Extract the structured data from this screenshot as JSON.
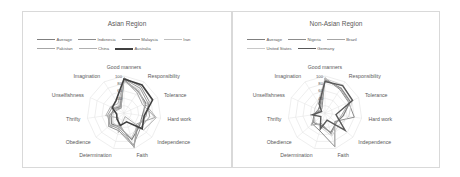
{
  "chart_data": [
    {
      "type": "radar",
      "title": "Asian Region",
      "axes": [
        "Good manners",
        "Responsibility",
        "Tolerance",
        "Hard work",
        "Independence",
        "Faith",
        "Determination",
        "Obedience",
        "Thrifty",
        "Unselfishness",
        "Imagination"
      ],
      "ticks": [
        "100",
        "80",
        "60",
        "40",
        "20"
      ],
      "range": [
        0,
        100
      ],
      "legend_rows": [
        [
          "Average",
          "Indonesia",
          "Malaysia",
          "Iran"
        ],
        [
          "Pakistan",
          "China",
          "Australia"
        ]
      ],
      "series": [
        {
          "name": "Average",
          "color": "#7f7f7f",
          "width": 1.2,
          "values": [
            90,
            70,
            65,
            50,
            55,
            75,
            40,
            45,
            35,
            30,
            20
          ]
        },
        {
          "name": "Indonesia",
          "color": "#8c8c8c",
          "width": 1.0,
          "values": [
            95,
            85,
            75,
            60,
            50,
            95,
            50,
            55,
            40,
            25,
            15
          ]
        },
        {
          "name": "Malaysia",
          "color": "#9a9a9a",
          "width": 1.0,
          "values": [
            92,
            80,
            70,
            70,
            60,
            90,
            45,
            50,
            45,
            35,
            20
          ]
        },
        {
          "name": "Iran",
          "color": "#bfbfbf",
          "width": 0.8,
          "values": [
            85,
            75,
            60,
            55,
            50,
            70,
            40,
            40,
            30,
            30,
            25
          ]
        },
        {
          "name": "Pakistan",
          "color": "#a6a6a6",
          "width": 1.0,
          "values": [
            90,
            65,
            55,
            85,
            45,
            98,
            35,
            55,
            40,
            20,
            15
          ]
        },
        {
          "name": "China",
          "color": "#b0b0b0",
          "width": 1.0,
          "values": [
            88,
            70,
            62,
            88,
            70,
            10,
            55,
            20,
            50,
            40,
            30
          ]
        },
        {
          "name": "Australia",
          "color": "#404040",
          "width": 1.6,
          "values": [
            92,
            90,
            85,
            55,
            65,
            25,
            35,
            25,
            20,
            35,
            40
          ]
        }
      ]
    },
    {
      "type": "radar",
      "title": "Non-Asian Region",
      "axes": [
        "Good manners",
        "Responsibility",
        "Tolerance",
        "Hard work",
        "Independence",
        "Faith",
        "Determination",
        "Obedience",
        "Thrifty",
        "Unselfishness",
        "Imagination"
      ],
      "ticks": [
        "100",
        "80",
        "60",
        "40",
        "20"
      ],
      "range": [
        0,
        100
      ],
      "legend_rows": [
        [
          "Average",
          "Nigeria",
          "Brazil"
        ],
        [
          "United States",
          "Germany"
        ]
      ],
      "series": [
        {
          "name": "Average",
          "color": "#7f7f7f",
          "width": 1.2,
          "values": [
            90,
            80,
            75,
            50,
            40,
            55,
            35,
            40,
            30,
            20,
            25
          ]
        },
        {
          "name": "Nigeria",
          "color": "#8c8c8c",
          "width": 1.0,
          "values": [
            95,
            75,
            70,
            80,
            35,
            95,
            50,
            45,
            30,
            15,
            15
          ]
        },
        {
          "name": "Brazil",
          "color": "#a6a6a6",
          "width": 1.0,
          "values": [
            92,
            78,
            72,
            45,
            40,
            60,
            30,
            50,
            25,
            20,
            20
          ]
        },
        {
          "name": "United States",
          "color": "#c8c8c8",
          "width": 0.8,
          "values": [
            93,
            90,
            80,
            65,
            50,
            65,
            40,
            35,
            30,
            30,
            35
          ]
        },
        {
          "name": "Germany",
          "color": "#595959",
          "width": 1.4,
          "values": [
            85,
            88,
            82,
            30,
            72,
            20,
            45,
            15,
            35,
            10,
            30
          ]
        }
      ]
    }
  ]
}
